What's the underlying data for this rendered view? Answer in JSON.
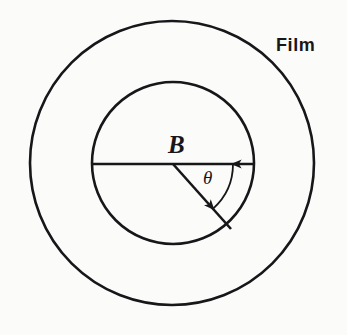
{
  "figure": {
    "background_color": "#fbfbfa",
    "stroke_color": "#17171a",
    "labels": {
      "film": "Film",
      "center_point": "B",
      "angle": "θ"
    },
    "geometry": {
      "outer_circle": {
        "name": "film-outer-circle",
        "cx": 172,
        "cy": 163,
        "r": 142,
        "stroke_width": 2.6
      },
      "inner_circle": {
        "name": "inner-circle",
        "cx": 173,
        "cy": 163,
        "r": 81,
        "stroke_width": 2.6
      },
      "horizontal_diameter": {
        "name": "horizontal-diameter-line",
        "x1": 92,
        "y1": 164,
        "x2": 254,
        "y2": 164,
        "stroke_width": 2.6
      },
      "radius_line": {
        "name": "angled-radius-line",
        "x1": 173,
        "y1": 164,
        "x2": 231,
        "y2": 229,
        "angle_degrees_below_horizontal": 48,
        "stroke_width": 2.6
      },
      "angle_arc_arrow": {
        "name": "angle-arc-double-arrow",
        "center_x": 173,
        "center_y": 164,
        "radius": 60,
        "start_angle_degrees": 0,
        "end_angle_degrees": 48,
        "double_headed": true,
        "stroke_width": 1.8
      }
    }
  }
}
